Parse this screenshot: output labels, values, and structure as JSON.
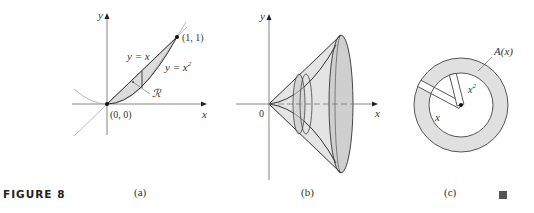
{
  "figure": {
    "label": "FIGURE 8",
    "end_mark": "■"
  },
  "panels": [
    {
      "id": "a",
      "caption": "(a)",
      "axis_x": "x",
      "axis_y": "y",
      "curve_line_label": "y = x",
      "curve_parab_label": "y = x",
      "curve_parab_exp": "2",
      "region_label": "ℛ",
      "origin_label": "(0, 0)",
      "point_label": "(1, 1)"
    },
    {
      "id": "b",
      "caption": "(b)",
      "axis_x": "x",
      "axis_y": "y",
      "origin_label": "0"
    },
    {
      "id": "c",
      "caption": "(c)",
      "area_label": "A(x)",
      "outer_radius_label": "x",
      "inner_radius_label": "x",
      "inner_radius_exp": "2"
    }
  ],
  "colors": {
    "shade": "#d9d9d9",
    "shade_dark": "#bdbdbd",
    "stroke": "#333333",
    "axis": "#555555",
    "light_curve": "#aaaaaa"
  }
}
